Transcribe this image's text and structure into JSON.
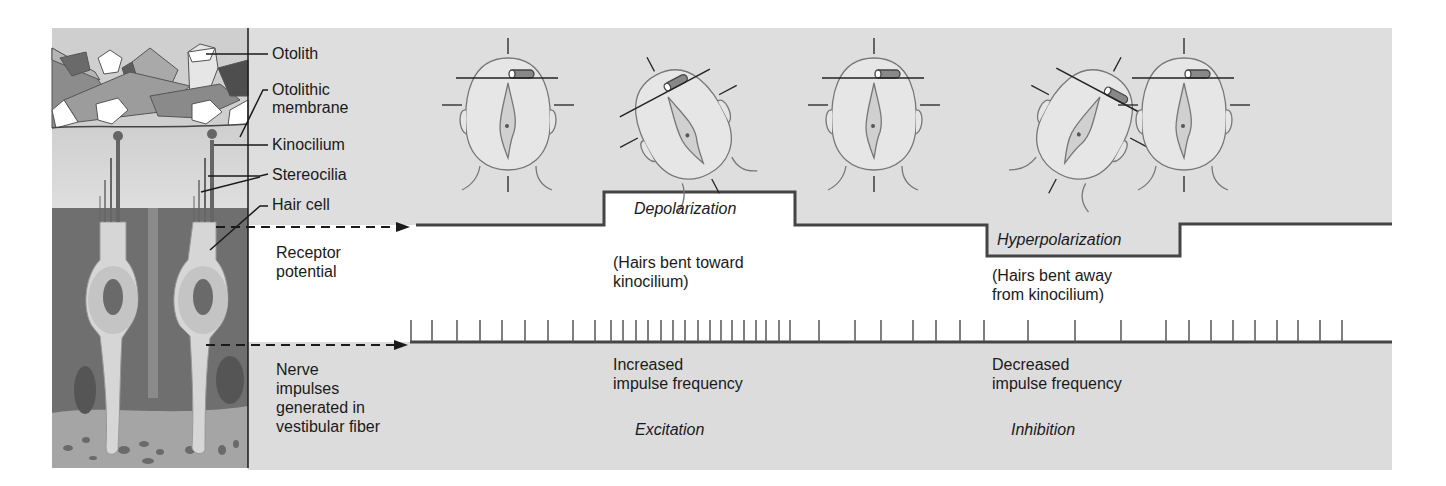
{
  "figure": {
    "colors": {
      "panel_gray": "#dcdcdc",
      "panel_light": "#e4e4e4",
      "white_band": "#ffffff",
      "line_dark": "#333333",
      "tissue_dark": "#6e6e6e",
      "tissue_mid": "#9a9a9a",
      "cell_light": "#c8c8c8",
      "cell_lighter": "#d9d9d9"
    },
    "anatomy_labels": {
      "otolith": "Otolith",
      "otolithic_membrane_line1": "Otolithic",
      "otolithic_membrane_line2": "membrane",
      "kinocilium": "Kinocilium",
      "stereocilia": "Stereocilia",
      "hair_cell": "Hair cell"
    },
    "row_labels": {
      "receptor_potential_line1": "Receptor",
      "receptor_potential_line2": "potential",
      "nerve_line1": "Nerve",
      "nerve_line2": "impulses",
      "nerve_line3": "generated in",
      "nerve_line4": "vestibular fiber"
    },
    "receptor_potential": {
      "depolarization": "Depolarization",
      "depolarization_note_line1": "(Hairs bent toward",
      "depolarization_note_line2": "kinocilium)",
      "hyperpolarization": "Hyperpolarization",
      "hyperpolarization_note_line1": "(Hairs bent away",
      "hyperpolarization_note_line2": "from kinocilium)"
    },
    "nerve_impulses": {
      "increased_line1": "Increased",
      "increased_line2": "impulse frequency",
      "excitation": "Excitation",
      "decreased_line1": "Decreased",
      "decreased_line2": "impulse frequency",
      "inhibition": "Inhibition"
    },
    "head_positions": [
      {
        "tilt": "upright",
        "angle_deg": 0
      },
      {
        "tilt": "tilted-toward-kinocilium",
        "angle_deg": -28
      },
      {
        "tilt": "upright",
        "angle_deg": 0
      },
      {
        "tilt": "tilted-away-from-kinocilium",
        "angle_deg": 28
      },
      {
        "tilt": "upright",
        "angle_deg": 0
      }
    ],
    "spike_x": [
      411,
      432,
      457,
      480,
      502,
      525,
      548,
      573,
      595,
      611,
      623,
      636,
      648,
      661,
      673,
      685,
      698,
      710,
      721,
      732,
      744,
      756,
      766,
      779,
      790,
      819,
      855,
      881,
      913,
      936,
      960,
      984,
      1028,
      1075,
      1121,
      1166,
      1189,
      1211,
      1233,
      1255,
      1277,
      1298,
      1320,
      1342
    ]
  }
}
